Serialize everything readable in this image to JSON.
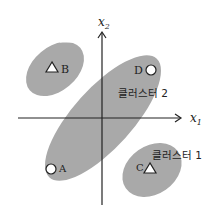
{
  "diagram": {
    "axes": {
      "x_label": "x",
      "x_sub": "1",
      "y_label": "x",
      "y_sub": "2"
    },
    "clusters": [
      {
        "id": "cluster-b",
        "label": ""
      },
      {
        "id": "cluster-2",
        "label": "클러스터 2"
      },
      {
        "id": "cluster-1",
        "label": "클러스터 1"
      }
    ],
    "points": [
      {
        "name": "A",
        "shape": "circle"
      },
      {
        "name": "B",
        "shape": "triangle"
      },
      {
        "name": "C",
        "shape": "triangle"
      },
      {
        "name": "D",
        "shape": "circle"
      }
    ],
    "colors": {
      "cluster_fill": "#a9a9a9",
      "axis": "#222222",
      "marker_fill": "#ffffff"
    }
  }
}
